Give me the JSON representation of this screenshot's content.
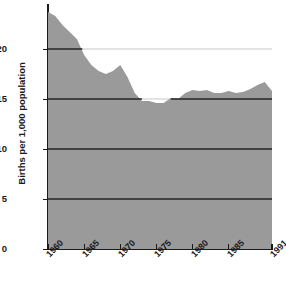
{
  "chart_data": {
    "type": "area",
    "title": "",
    "xlabel": "",
    "ylabel": "Births per 1,000 population",
    "ylim": [
      0,
      24.5
    ],
    "xlim": [
      1960,
      1991
    ],
    "yticks": [
      0,
      5,
      10,
      15,
      20
    ],
    "ytick_labels": [
      "0",
      "5",
      "10",
      "15",
      "20"
    ],
    "xticks": [
      1960,
      1965,
      1970,
      1975,
      1980,
      1985,
      1991
    ],
    "xtick_labels": [
      "1960",
      "1965",
      "1970",
      "1975",
      "1980",
      "1985",
      "1991"
    ],
    "grid": "horizontal gridlines at 5, 10, 15, 20",
    "fill_color": "#9a9a9a",
    "line_color": "#1a1a1a",
    "series": [
      {
        "name": "Births per 1,000 population",
        "x": [
          1960,
          1961,
          1962,
          1963,
          1964,
          1965,
          1966,
          1967,
          1968,
          1969,
          1970,
          1971,
          1972,
          1973,
          1974,
          1975,
          1976,
          1977,
          1978,
          1979,
          1980,
          1981,
          1982,
          1983,
          1984,
          1985,
          1986,
          1987,
          1988,
          1989,
          1990,
          1991
        ],
        "values": [
          23.7,
          23.3,
          22.4,
          21.7,
          21.0,
          19.4,
          18.4,
          17.8,
          17.5,
          17.8,
          18.4,
          17.2,
          15.6,
          14.8,
          14.8,
          14.6,
          14.6,
          15.1,
          15.0,
          15.6,
          15.9,
          15.8,
          15.9,
          15.6,
          15.6,
          15.8,
          15.6,
          15.7,
          16.0,
          16.4,
          16.7,
          15.8
        ]
      }
    ]
  },
  "axis": {
    "ylabel_text": "Births per 1,000 population"
  }
}
